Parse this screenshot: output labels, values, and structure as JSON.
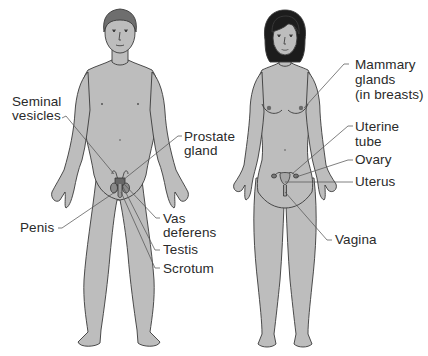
{
  "diagram": {
    "type": "anatomical illustration",
    "colors": {
      "skin": "#bdbdbd",
      "outline": "#3a3a3a",
      "male_hair": "#6e6e6e",
      "female_hair": "#1c1c1c",
      "background": "#ffffff",
      "leader_line": "#555555"
    }
  },
  "male": {
    "labels": {
      "seminal_vesicles": "Seminal\nvesicles",
      "prostate_gland": "Prostate\ngland",
      "penis": "Penis",
      "vas_deferens": "Vas\ndeferens",
      "testis": "Testis",
      "scrotum": "Scrotum"
    }
  },
  "female": {
    "labels": {
      "mammary_glands": "Mammary\nglands\n(in breasts)",
      "uterine_tube": "Uterine\ntube",
      "ovary": "Ovary",
      "uterus": "Uterus",
      "vagina": "Vagina"
    }
  }
}
